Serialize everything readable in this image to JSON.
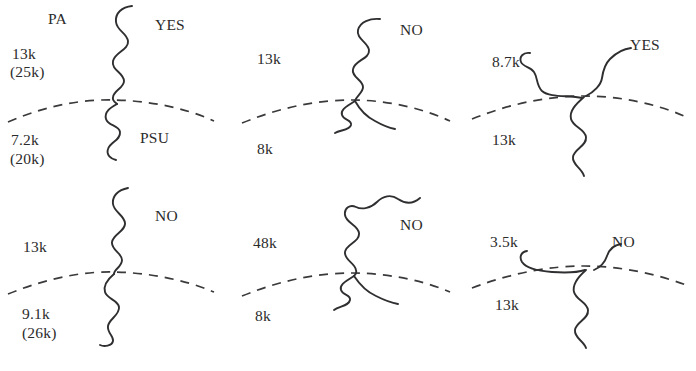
{
  "figure": {
    "width": 696,
    "height": 371,
    "background": "#ffffff",
    "ink_color": "#2f2f31",
    "text_color": "#2b2b2b"
  },
  "panels": [
    {
      "id": "top-left",
      "top_polymer_label": "PA",
      "bottom_polymer_label": "PSU",
      "answer": "YES",
      "top_mw": "13k",
      "top_mw_alt": "(25k)",
      "bottom_mw": "7.2k",
      "bottom_mw_alt": "(20k)",
      "arms_above": 1,
      "arms_below": 1
    },
    {
      "id": "top-middle",
      "top_polymer_label": "",
      "bottom_polymer_label": "",
      "answer": "NO",
      "top_mw": "13k",
      "top_mw_alt": "",
      "bottom_mw": "8k",
      "bottom_mw_alt": "",
      "arms_above": 1,
      "arms_below": 2
    },
    {
      "id": "top-right",
      "top_polymer_label": "",
      "bottom_polymer_label": "",
      "answer": "YES",
      "top_mw": "8.7k",
      "top_mw_alt": "",
      "bottom_mw": "13k",
      "bottom_mw_alt": "",
      "arms_above": 2,
      "arms_below": 1
    },
    {
      "id": "bottom-left",
      "top_polymer_label": "",
      "bottom_polymer_label": "",
      "answer": "NO",
      "top_mw": "13k",
      "top_mw_alt": "",
      "bottom_mw": "9.1k",
      "bottom_mw_alt": "(26k)",
      "arms_above": 1,
      "arms_below": 1
    },
    {
      "id": "bottom-middle",
      "top_polymer_label": "",
      "bottom_polymer_label": "",
      "answer": "NO",
      "top_mw": "48k",
      "top_mw_alt": "",
      "bottom_mw": "8k",
      "bottom_mw_alt": "",
      "arms_above": 1,
      "arms_below": 2
    },
    {
      "id": "bottom-right",
      "top_polymer_label": "",
      "bottom_polymer_label": "",
      "answer": "NO",
      "top_mw": "3.5k",
      "top_mw_alt": "",
      "bottom_mw": "13k",
      "bottom_mw_alt": "",
      "arms_above": 2,
      "arms_below": 1
    }
  ]
}
